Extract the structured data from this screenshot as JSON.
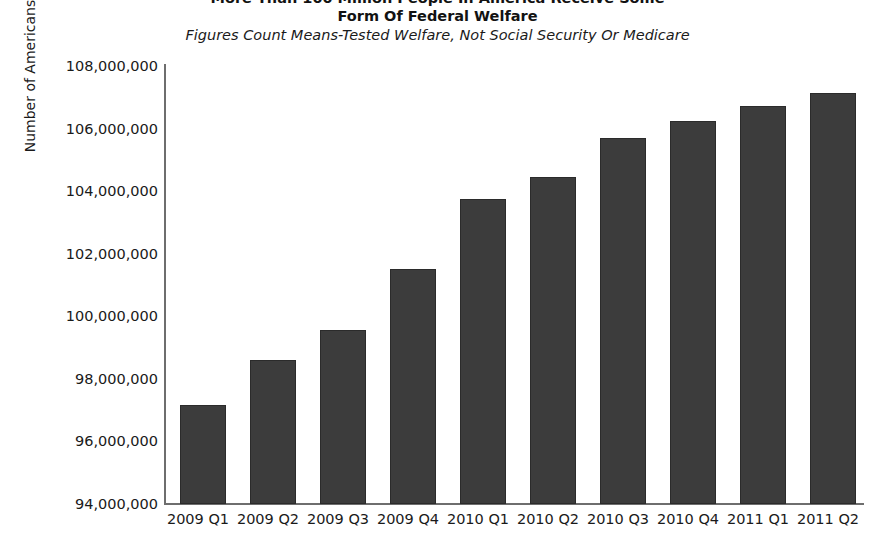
{
  "chart_data": {
    "type": "bar",
    "title": "More Than 100 Million People In America Receive Some Form Of Federal Welfare",
    "title_lines": [
      "More Than 100 Million People In America Receive Some",
      "Form Of Federal Welfare"
    ],
    "subtitle": "Figures Count Means-Tested Welfare, Not Social Security Or Medicare",
    "xlabel": "",
    "ylabel": "Number of Americans",
    "categories": [
      "2009 Q1",
      "2009 Q2",
      "2009 Q3",
      "2009 Q4",
      "2010 Q1",
      "2010 Q2",
      "2010 Q3",
      "2010 Q4",
      "2011 Q1",
      "2011 Q2"
    ],
    "values": [
      97160000,
      98600000,
      99550000,
      101500000,
      103750000,
      104450000,
      105700000,
      106250000,
      106720000,
      107150000
    ],
    "ylim": [
      94000000,
      108000000
    ],
    "ytick_labels": [
      "108,000,000",
      "106,000,000",
      "104,000,000",
      "102,000,000",
      "100,000,000",
      "98,000,000",
      "96,000,000",
      "94,000,000"
    ],
    "ytick_values": [
      108000000,
      106000000,
      104000000,
      102000000,
      100000000,
      98000000,
      96000000,
      94000000
    ],
    "grid": false,
    "legend": null,
    "bar_color": "#3c3c3c",
    "axis_color": "#6e6e6e",
    "background_color": "#ffffff"
  }
}
